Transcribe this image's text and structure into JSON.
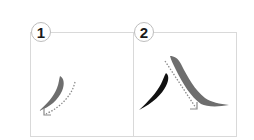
{
  "diagram": {
    "type": "stroke-order",
    "character": "八",
    "steps": [
      {
        "number": "1",
        "description": "left-falling stroke (pie), highlighted gray with dotted arrow down-left"
      },
      {
        "number": "2",
        "description": "right-falling stroke (na), highlighted gray with dotted arrow down-right; first stroke shown in black"
      }
    ],
    "colors": {
      "active_stroke": "#6e6e6e",
      "done_stroke": "#111111",
      "arrow": "#8a8a8a",
      "frame": "#d9d9d9"
    }
  }
}
